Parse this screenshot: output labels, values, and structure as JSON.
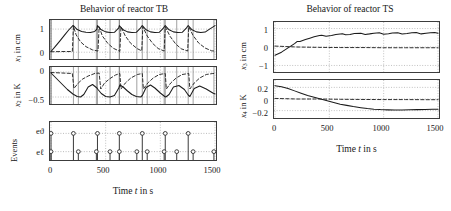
{
  "figure": {
    "left": {
      "title": "Behavior of reactor TB",
      "xlabel_prefix": "Time",
      "xlabel_var": "t",
      "xlabel_suffix": "in s",
      "xticks": [
        "0",
        "500",
        "1000",
        "1500"
      ],
      "xlim": [
        -30,
        1560
      ],
      "panels": [
        {
          "name": "x1",
          "ylabel_var": "x",
          "ylabel_sub": "1",
          "ylabel_unit": "in cm",
          "yticks": [
            "1",
            "0"
          ],
          "ytick_values": [
            1,
            0
          ],
          "ylim": [
            -0.25,
            1.35
          ]
        },
        {
          "name": "x2",
          "ylabel_var": "x",
          "ylabel_sub": "2",
          "ylabel_unit": "in K",
          "yticks": [
            "0",
            "−0.5"
          ],
          "ytick_values": [
            0,
            -0.5
          ],
          "ylim": [
            -0.62,
            0.08
          ]
        },
        {
          "name": "events",
          "ylabel_unit": "Events",
          "row_labels": [
            "eϑ",
            "eℓ"
          ]
        }
      ]
    },
    "right": {
      "title": "Behavior of reactor TS",
      "xlabel_prefix": "Time",
      "xlabel_var": "t",
      "xlabel_suffix": "in s",
      "xticks": [
        "0",
        "500",
        "1000",
        "1500"
      ],
      "xlim": [
        -30,
        1560
      ],
      "panels": [
        {
          "name": "x3",
          "ylabel_var": "x",
          "ylabel_sub": "3",
          "ylabel_unit": "in cm",
          "yticks": [
            "1",
            "0",
            "−1"
          ],
          "ytick_values": [
            1,
            0,
            -1
          ],
          "ylim": [
            -1.3,
            1.3
          ]
        },
        {
          "name": "x4",
          "ylabel_var": "x",
          "ylabel_sub": "4",
          "ylabel_unit": "in K",
          "yticks": [
            "0.2",
            "0",
            "−0.2"
          ],
          "ytick_values": [
            0.2,
            0,
            -0.2
          ],
          "ylim": [
            -0.31,
            0.31
          ]
        }
      ]
    }
  },
  "chart_data": {
    "type": "line",
    "xlabel": "Time t in s",
    "grid": true,
    "legend": "none",
    "subplots": [
      {
        "id": "x1",
        "title": "Behavior of reactor TB",
        "ylabel": "x1 in cm",
        "xlim": [
          0,
          1500
        ],
        "ylim": [
          -0.25,
          1.35
        ],
        "yticks": [
          0,
          1
        ],
        "xticks": [
          0,
          500,
          1000,
          1500
        ],
        "series": [
          {
            "name": "x1-solid",
            "style": "solid",
            "comment": "sawtooth: rises from 0 to ~1.15 at t=200, then repeating decay-rise cycles peaking ~1.15",
            "x": [
              0,
              40,
              80,
              120,
              160,
              200,
              205,
              240,
              280,
              320,
              360,
              400,
              420,
              425,
              460,
              500,
              540,
              580,
              620,
              625,
              660,
              700,
              740,
              780,
              820,
              830,
              835,
              870,
              910,
              950,
              990,
              1030,
              1040,
              1045,
              1080,
              1120,
              1160,
              1200,
              1240,
              1250,
              1255,
              1290,
              1330,
              1370,
              1410,
              1450,
              1490,
              1500
            ],
            "y": [
              0.03,
              0.25,
              0.48,
              0.72,
              0.95,
              1.15,
              1.15,
              0.98,
              0.9,
              0.86,
              0.85,
              0.9,
              1.0,
              1.15,
              0.97,
              0.88,
              0.85,
              0.86,
              1.05,
              1.15,
              0.97,
              0.88,
              0.85,
              0.86,
              1.05,
              1.13,
              1.15,
              0.97,
              0.88,
              0.85,
              0.86,
              1.05,
              1.13,
              1.15,
              0.97,
              0.88,
              0.85,
              0.86,
              1.05,
              1.13,
              1.15,
              0.97,
              0.88,
              0.85,
              0.87,
              1.0,
              1.12,
              1.15
            ]
          },
          {
            "name": "x1-dashed",
            "style": "dashed",
            "comment": "near 0 baseline with decaying humps after each event",
            "x": [
              0,
              100,
              195,
              205,
              230,
              270,
              320,
              380,
              430,
              440,
              470,
              520,
              570,
              620,
              630,
              640,
              680,
              730,
              790,
              830,
              840,
              880,
              930,
              980,
              1035,
              1045,
              1090,
              1140,
              1190,
              1250,
              1260,
              1300,
              1350,
              1410,
              1470,
              1500
            ],
            "y": [
              0.02,
              0.03,
              0.03,
              1.12,
              0.75,
              0.45,
              0.24,
              0.1,
              0.05,
              1.1,
              0.7,
              0.38,
              0.17,
              0.06,
              0.04,
              1.1,
              0.7,
              0.38,
              0.15,
              0.06,
              1.1,
              0.7,
              0.38,
              0.16,
              0.05,
              1.1,
              0.68,
              0.36,
              0.15,
              0.05,
              1.1,
              0.72,
              0.4,
              0.18,
              0.06,
              0.05
            ]
          }
        ]
      },
      {
        "id": "x2",
        "title": "Behavior of reactor TB",
        "ylabel": "x2 in K",
        "xlim": [
          0,
          1500
        ],
        "ylim": [
          -0.62,
          0.08
        ],
        "yticks": [
          0,
          -0.5
        ],
        "xticks": [
          0,
          500,
          1000,
          1500
        ],
        "series": [
          {
            "name": "x2-solid",
            "style": "solid",
            "comment": "decays from 0 to -0.5 then sawtooth recovering and re-decaying each cycle",
            "x": [
              0,
              50,
              100,
              150,
              200,
              240,
              270,
              300,
              340,
              380,
              420,
              430,
              460,
              500,
              540,
              580,
              620,
              630,
              660,
              700,
              740,
              780,
              820,
              835,
              870,
              910,
              950,
              1000,
              1040,
              1050,
              1080,
              1120,
              1170,
              1220,
              1255,
              1270,
              1310,
              1360,
              1420,
              1480,
              1500
            ],
            "y": [
              -0.02,
              -0.13,
              -0.24,
              -0.35,
              -0.44,
              -0.49,
              -0.5,
              -0.45,
              -0.3,
              -0.25,
              -0.32,
              -0.35,
              -0.43,
              -0.49,
              -0.5,
              -0.47,
              -0.32,
              -0.26,
              -0.3,
              -0.38,
              -0.45,
              -0.49,
              -0.5,
              -0.47,
              -0.31,
              -0.26,
              -0.32,
              -0.42,
              -0.49,
              -0.5,
              -0.45,
              -0.3,
              -0.27,
              -0.35,
              -0.46,
              -0.49,
              -0.33,
              -0.28,
              -0.34,
              -0.42,
              -0.44
            ]
          },
          {
            "name": "x2-dashed",
            "style": "dashed",
            "comment": "stays near 0, dips after each event then returns to 0",
            "x": [
              0,
              100,
              195,
              210,
              250,
              290,
              340,
              400,
              440,
              455,
              490,
              540,
              590,
              630,
              640,
              680,
              730,
              790,
              835,
              845,
              885,
              935,
              990,
              1045,
              1055,
              1095,
              1145,
              1200,
              1260,
              1270,
              1310,
              1360,
              1420,
              1480,
              1500
            ],
            "y": [
              -0.01,
              -0.02,
              -0.03,
              -0.33,
              -0.22,
              -0.14,
              -0.08,
              -0.03,
              -0.02,
              -0.34,
              -0.22,
              -0.13,
              -0.06,
              -0.03,
              -0.34,
              -0.22,
              -0.12,
              -0.05,
              -0.03,
              -0.34,
              -0.22,
              -0.12,
              -0.05,
              -0.03,
              -0.34,
              -0.22,
              -0.12,
              -0.05,
              -0.03,
              -0.34,
              -0.22,
              -0.12,
              -0.05,
              -0.03,
              -0.03
            ]
          }
        ]
      },
      {
        "id": "events",
        "title": "Behavior of reactor TB",
        "ylabel": "Events",
        "xlim": [
          0,
          1500
        ],
        "rows": [
          "eϑ",
          "eℓ"
        ],
        "xticks": [
          0,
          500,
          1000,
          1500
        ],
        "stems": {
          "e_theta": [
            0,
            205,
            425,
            625,
            835,
            1045,
            1255
          ],
          "e_l": [
            0,
            250,
            415,
            540,
            625,
            785,
            880,
            1035,
            1150,
            1300,
            1490
          ]
        }
      },
      {
        "id": "x3",
        "title": "Behavior of reactor TS",
        "ylabel": "x3 in cm",
        "xlim": [
          0,
          1500
        ],
        "ylim": [
          -1.3,
          1.3
        ],
        "yticks": [
          1,
          0,
          -1
        ],
        "xticks": [
          0,
          500,
          1000,
          1500
        ],
        "series": [
          {
            "name": "x3-solid",
            "style": "solid",
            "comment": "rises from -0.45 with small ripples settling near 0.72",
            "x": [
              0,
              60,
              120,
              180,
              205,
              230,
              280,
              320,
              360,
              410,
              430,
              470,
              520,
              560,
              620,
              650,
              690,
              730,
              790,
              830,
              870,
              910,
              960,
              1000,
              1045,
              1080,
              1130,
              1170,
              1215,
              1260,
              1300,
              1345,
              1390,
              1430,
              1470,
              1500
            ],
            "y": [
              -0.45,
              -0.28,
              -0.05,
              0.18,
              0.3,
              0.3,
              0.4,
              0.48,
              0.55,
              0.62,
              0.64,
              0.58,
              0.62,
              0.68,
              0.72,
              0.66,
              0.68,
              0.73,
              0.75,
              0.68,
              0.71,
              0.75,
              0.77,
              0.69,
              0.72,
              0.76,
              0.77,
              0.7,
              0.73,
              0.77,
              0.78,
              0.71,
              0.74,
              0.77,
              0.78,
              0.74
            ]
          },
          {
            "name": "x3-dashed",
            "style": "dashed",
            "comment": "flat near 0",
            "x": [
              0,
              200,
              400,
              600,
              800,
              1000,
              1200,
              1400,
              1500
            ],
            "y": [
              0.05,
              0.0,
              -0.02,
              -0.03,
              -0.03,
              -0.04,
              -0.04,
              -0.04,
              -0.04
            ]
          }
        ]
      },
      {
        "id": "x4",
        "title": "Behavior of reactor TS",
        "ylabel": "x4 in K",
        "xlim": [
          0,
          1500
        ],
        "ylim": [
          -0.31,
          0.31
        ],
        "yticks": [
          0.2,
          0,
          -0.2
        ],
        "xticks": [
          0,
          500,
          1000,
          1500
        ],
        "series": [
          {
            "name": "x4-solid",
            "style": "solid",
            "comment": "decays from 0.23 through 0 near t=430 settling near -0.18",
            "x": [
              0,
              60,
              120,
              180,
              240,
              300,
              360,
              420,
              480,
              540,
              600,
              660,
              720,
              790,
              850,
              910,
              970,
              1040,
              1100,
              1170,
              1240,
              1310,
              1380,
              1450,
              1500
            ],
            "y": [
              0.23,
              0.21,
              0.18,
              0.14,
              0.1,
              0.06,
              0.03,
              0.0,
              -0.03,
              -0.06,
              -0.09,
              -0.11,
              -0.13,
              -0.15,
              -0.165,
              -0.175,
              -0.182,
              -0.187,
              -0.19,
              -0.188,
              -0.185,
              -0.183,
              -0.18,
              -0.178,
              -0.177
            ]
          },
          {
            "name": "x4-dashed",
            "style": "dashed",
            "comment": "flat near 0",
            "x": [
              0,
              200,
              400,
              600,
              800,
              1000,
              1200,
              1400,
              1500
            ],
            "y": [
              0.01,
              0.0,
              0.0,
              -0.005,
              -0.008,
              -0.01,
              -0.01,
              -0.012,
              -0.012
            ]
          }
        ]
      }
    ]
  }
}
